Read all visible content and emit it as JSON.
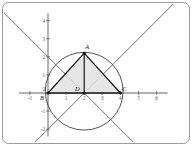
{
  "figure": {
    "kind": "geometry-plot",
    "border_color": "#9a9a9a",
    "background": "#ffffff",
    "axis_color": "#555555",
    "grid": false
  },
  "axes": {
    "x": {
      "label_values": [
        "-1",
        "1",
        "2",
        "3",
        "4",
        "5",
        "6"
      ],
      "min": -1.6,
      "max": 6.6,
      "origin_px": 48,
      "unit_px": 18.1
    },
    "y": {
      "label_values": [
        "4",
        "3",
        "2",
        "1",
        "0",
        "-1",
        "-2"
      ],
      "min": -2.4,
      "max": 4.4,
      "origin_px": 93,
      "unit_px": 18.1
    }
  },
  "chart_data": {
    "type": "scatter",
    "title": "",
    "xlabel": "",
    "ylabel": "",
    "xlim": [
      -1.6,
      6.6
    ],
    "ylim": [
      -2.4,
      4.4
    ],
    "xticks": [
      -1,
      1,
      2,
      3,
      4,
      5,
      6
    ],
    "yticks": [
      -2,
      -1,
      0,
      1,
      2,
      3,
      4
    ],
    "points": [
      {
        "name": "A",
        "x": 2.0,
        "y": 2.2,
        "label_dx": 3,
        "label_dy": -4
      },
      {
        "name": "B",
        "x": 0.0,
        "y": 0.0,
        "label_dx": -6,
        "label_dy": 7
      },
      {
        "name": "C",
        "x": 4.0,
        "y": 0.0,
        "label_dx": 4,
        "label_dy": -2
      },
      {
        "name": "D",
        "x": 2.0,
        "y": 0.0,
        "label_dx": -7,
        "label_dy": -2
      }
    ],
    "circle": {
      "cx": 2.0,
      "cy": 0.1,
      "r": 2.15,
      "stroke": "#3d3d3d"
    },
    "triangle": {
      "vertices": [
        [
          2.0,
          2.2
        ],
        [
          0.0,
          0.0
        ],
        [
          4.0,
          0.0
        ]
      ],
      "fill": "#e2e2e2",
      "stroke": "#1a1a1a"
    },
    "segments": [
      {
        "from": [
          2.0,
          2.2
        ],
        "to": [
          2.0,
          0.0
        ],
        "stroke": "#1a1a1a"
      }
    ],
    "lines": [
      {
        "name": "line-up-right",
        "through": [
          2.0,
          0.0
        ],
        "slope": 1,
        "stroke": "#4a4a4a"
      },
      {
        "name": "line-up-left",
        "through": [
          2.0,
          0.0
        ],
        "slope": -1,
        "stroke": "#4a4a4a"
      }
    ]
  }
}
